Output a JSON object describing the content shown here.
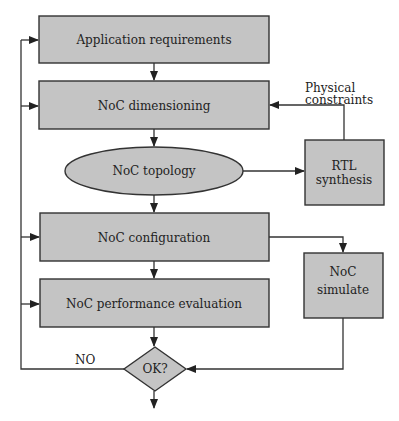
{
  "nodes": {
    "app_requirements": "Application requirements",
    "noc_dimensioning": "NoC dimensioning",
    "noc_topology": "NoC topology",
    "rtl_synthesis": [
      "RTL",
      "synthesis"
    ],
    "noc_configuration": "NoC configuration",
    "noc_performance": "NoC performance evaluation",
    "noc_simulate": [
      "NoC",
      "simulate"
    ],
    "decision": "OK?"
  },
  "edge_labels": {
    "physical_constraints": [
      "Physical",
      "constraints"
    ],
    "no": "NO"
  },
  "colors": {
    "node_fill": "#c4c4c4",
    "stroke": "#333333"
  }
}
